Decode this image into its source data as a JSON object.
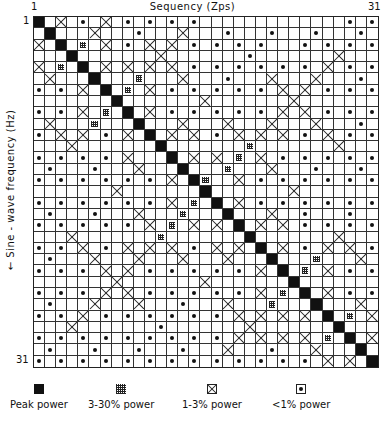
{
  "chart_data": {
    "type": "heatmap",
    "title": "",
    "xlabel": "Sequency (Zps)",
    "ylabel": "← Sine - wave frequency (Hz)",
    "x_ticks": [
      "1",
      "31"
    ],
    "y_ticks": [
      "1",
      "31"
    ],
    "size": [
      31,
      31
    ],
    "legend": [
      {
        "key": "P",
        "symbol": "filled-square",
        "label": "Peak power"
      },
      {
        "key": "M",
        "symbol": "mesh-square",
        "label": "3-30% power"
      },
      {
        "key": "X",
        "symbol": "crossed-square",
        "label": "1-3% power"
      },
      {
        "key": "D",
        "symbol": "dotted-square",
        "label": "<1% power"
      }
    ],
    "encoding": "Each row string has 31 chars, one per sequency column 1..31: P=Peak, M=3-30%, X=1-3%, D=<1%, .=empty",
    "transcription_note": "Cell map was read from zoomed crops at ~11px/cell. Not every cell was read individually: where my row-by-row reads were incomplete or uncertain, cells were filled in from the chart's apparent symmetry rather than directly observed. Treat individual cell values as approximate, especially in the lower-left quadrant.",
    "rows": [
      "P.X.D.X.D.D.D.D.............D.D",
      ".P...X...D...X...D...D...D...D.",
      "X.P.M.X.D.X.X.D.D.D.D...D.D.D.D",
      "...P.......X.......D.......X...",
      "X.M.P.X.X.X.X.D.D.D.D.D.D.X.D.D",
      ".X...P...M...X...D...X...X...D.",
      "D.D.X.P.M.X.D.D.D.D.D.X.X.D.D.D",
      ".......P.......X.......X.......",
      "D.D.X.M.P.X.D.D.D.D.D.X.X.D.D.D",
      ".X...M...P...X...X...X...X...D.",
      "D.X.X.D.X.P.X.X.D.X.X.X.D.X.D.D",
      "...X.......P.......M.......X...",
      "D.D.D.D.X...P.X.X.M.X.D.D.D.D.D",
      ".D...D...X...P...M...X...D...D.",
      "D.D.D.D.D.D.X.PM..X.D.D.D.D.D.D",
      ".......X.......P.......X.......",
      "D.D.D.D.D.D.X.M.P.X.D.D.D.D.D.D",
      ".D...D...X...M...P...X..D...D..",
      "D.D.D.D.D.X.M.X.X.P.X.X.D.D.D.D",
      "...X.......M.......P.......X...",
      "D.D.X.D.X.X.X.D.X.X.P.X.D.X.X.D",
      ".D...X...X...X...X...P...M...X.",
      "D.D.D.X.X.D.D.D.D.D.X.P.M.X.D.D",
      ".......X.......X.......P.......",
      "D.D.D.X.X.D.D.D.D.D.X.M.P.X.D.D",
      ".D...X...X...D...X...M...P...X.",
      "D.D.X.D.D.D.D.D.D.X.X.X.X.P.M.X",
      "...X.......D.......X.......P...",
      "D.D.D.D.D.D.D.D.D.X.X.X.X.M.P.X",
      ".D...D...D...D...X...D...X...P.",
      "D.D.D.D.D.D.D.D.D.D.D.D.D.X.X.P"
    ]
  },
  "axes": {
    "x_title": "Sequency (Zps)",
    "y_title": "← Sine - wave frequency (Hz)",
    "x_tick_start": "1",
    "x_tick_end": "31",
    "y_tick_start": "1",
    "y_tick_end": "31"
  },
  "legend": {
    "peak": "Peak power",
    "mesh": "3-30% power",
    "cross": "1-3% power",
    "dot": "<1% power"
  }
}
